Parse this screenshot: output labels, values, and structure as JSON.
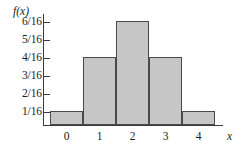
{
  "chart_data": {
    "type": "bar",
    "title": "",
    "subtitle": "",
    "xlabel": "x",
    "ylabel": "f(x)",
    "categories": [
      "0",
      "1",
      "2",
      "3",
      "4"
    ],
    "values": [
      0.0625,
      0.25,
      0.375,
      0.25,
      0.0625
    ],
    "value_labels": [
      "1/16",
      "4/16",
      "6/16",
      "4/16",
      "1/16"
    ],
    "ylim": [
      0,
      0.4375
    ],
    "ytick_values": [
      0.0625,
      0.125,
      0.1875,
      0.25,
      0.3125,
      0.375
    ],
    "ytick_labels": [
      "1/16",
      "2/16",
      "3/16",
      "4/16",
      "5/16",
      "6/16"
    ],
    "xtick_labels": [
      "0",
      "1",
      "2",
      "3",
      "4"
    ],
    "grid": false,
    "legend": false,
    "legend_position": "none",
    "bar_fill_color": "#c6c6c6",
    "bar_edge_color": "#4a4a4a",
    "axis_color": "#3a3a3a",
    "background_color": "#ffffff"
  },
  "axes": {
    "y_title": "f(x)",
    "x_title": "x",
    "y_ticks": [
      {
        "label": "6/16",
        "top": 22
      },
      {
        "label": "5/16",
        "top": 40
      },
      {
        "label": "4/16",
        "top": 58
      },
      {
        "label": "3/16",
        "top": 76
      },
      {
        "label": "2/16",
        "top": 94
      },
      {
        "label": "1/16",
        "top": 112
      }
    ],
    "x_ticks": [
      {
        "label": "0",
        "left": 50
      },
      {
        "label": "1",
        "left": 83
      },
      {
        "label": "2",
        "left": 116
      },
      {
        "label": "3",
        "left": 149
      },
      {
        "label": "4",
        "left": 182
      }
    ]
  },
  "bars": [
    {
      "category": "0",
      "label": "1/16",
      "left": 0,
      "height": 14
    },
    {
      "category": "1",
      "label": "4/16",
      "left": 33,
      "height": 68
    },
    {
      "category": "2",
      "label": "6/16",
      "left": 66,
      "height": 104
    },
    {
      "category": "3",
      "label": "4/16",
      "left": 99,
      "height": 68
    },
    {
      "category": "4",
      "label": "1/16",
      "left": 132,
      "height": 14
    }
  ]
}
